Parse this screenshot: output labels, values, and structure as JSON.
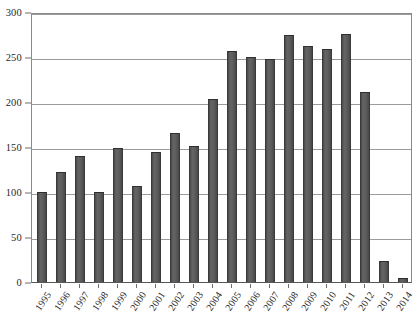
{
  "chart_data": {
    "type": "bar",
    "title": "",
    "subtitle": "",
    "xlabel": "",
    "ylabel": "",
    "categories": [
      "1995",
      "1996",
      "1997",
      "1998",
      "1999",
      "2000",
      "2001",
      "2002",
      "2003",
      "2004",
      "2005",
      "2006",
      "2007",
      "2008",
      "2009",
      "2010",
      "2011",
      "2012",
      "2013",
      "2014"
    ],
    "values": [
      100,
      122,
      140,
      100,
      149,
      107,
      144,
      166,
      151,
      203,
      257,
      250,
      248,
      274,
      262,
      259,
      276,
      211,
      23,
      4
    ],
    "series": [
      {
        "name": "",
        "values": [
          100,
          122,
          140,
          100,
          149,
          107,
          144,
          166,
          151,
          203,
          257,
          250,
          248,
          274,
          262,
          259,
          276,
          211,
          23,
          4
        ]
      }
    ],
    "ylim": [
      0,
      300
    ],
    "yticks": [
      0,
      50,
      100,
      150,
      200,
      250,
      300
    ],
    "ytick_labels": [
      "0",
      "50",
      "100",
      "150",
      "200",
      "250",
      "300"
    ],
    "grid": true,
    "grid_axis": "y",
    "legend": false,
    "legend_position": "none",
    "annotations": [],
    "colors": {
      "bar_fill": "#5a5a5a",
      "bar_edge": "#2f2f2f",
      "gridline": "#9b9b9b",
      "axis": "#8a8a8a",
      "background": "#ffffff",
      "text": "#2a2a2a"
    }
  }
}
